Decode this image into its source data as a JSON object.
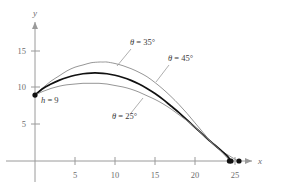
{
  "chart_data": {
    "type": "line",
    "title": "",
    "xlabel": "x",
    "ylabel": "y",
    "xlim": [
      0,
      27
    ],
    "ylim": [
      0,
      17
    ],
    "xticks": [
      5,
      10,
      15,
      20,
      25
    ],
    "yticks": [
      5,
      10,
      15
    ],
    "xtick_labels": [
      "5",
      "10",
      "15",
      "20",
      "25"
    ],
    "ytick_labels": [
      "5",
      "10",
      "15"
    ],
    "grid": false,
    "legend_position": "inline-annotations",
    "initial_height": 9,
    "initial_point": [
      0,
      9
    ],
    "series": [
      {
        "name": "theta = 35",
        "label": "θ = 35°",
        "color": "#8a8a8a",
        "width": 0.9,
        "apex": [
          8.5,
          13.5
        ],
        "landing": [
          25.5,
          0
        ],
        "points": [
          [
            0,
            9
          ],
          [
            1,
            10.0
          ],
          [
            2,
            10.9
          ],
          [
            3,
            11.6
          ],
          [
            4,
            12.3
          ],
          [
            5,
            12.8
          ],
          [
            6,
            13.1
          ],
          [
            7,
            13.4
          ],
          [
            8,
            13.5
          ],
          [
            8.5,
            13.5
          ],
          [
            9,
            13.5
          ],
          [
            10,
            13.3
          ],
          [
            11,
            13.0
          ],
          [
            12,
            12.6
          ],
          [
            13,
            12.1
          ],
          [
            14,
            11.5
          ],
          [
            15,
            10.7
          ],
          [
            16,
            9.8
          ],
          [
            17,
            8.8
          ],
          [
            18,
            7.7
          ],
          [
            19,
            6.5
          ],
          [
            20,
            5.2
          ],
          [
            21,
            3.9
          ],
          [
            22,
            2.6
          ],
          [
            23,
            1.6
          ],
          [
            24,
            0.9
          ],
          [
            25,
            0.25
          ],
          [
            25.5,
            0
          ]
        ]
      },
      {
        "name": "theta = 45",
        "label": "θ = 45°",
        "color": "#111111",
        "width": 1.7,
        "apex": [
          8.0,
          12.0
        ],
        "landing": [
          24.5,
          0
        ],
        "points": [
          [
            0,
            9
          ],
          [
            1,
            9.9
          ],
          [
            2,
            10.5
          ],
          [
            3,
            11.0
          ],
          [
            4,
            11.4
          ],
          [
            5,
            11.7
          ],
          [
            6,
            11.9
          ],
          [
            7,
            12.0
          ],
          [
            8,
            12.0
          ],
          [
            9,
            11.9
          ],
          [
            10,
            11.7
          ],
          [
            11,
            11.4
          ],
          [
            12,
            11.0
          ],
          [
            13,
            10.5
          ],
          [
            14,
            9.9
          ],
          [
            15,
            9.2
          ],
          [
            16,
            8.4
          ],
          [
            17,
            7.5
          ],
          [
            18,
            6.6
          ],
          [
            19,
            5.6
          ],
          [
            20,
            4.6
          ],
          [
            21,
            3.6
          ],
          [
            22,
            2.6
          ],
          [
            23,
            1.7
          ],
          [
            24,
            0.7
          ],
          [
            24.5,
            0
          ]
        ]
      },
      {
        "name": "theta = 25",
        "label": "θ = 25°",
        "color": "#8a8a8a",
        "width": 0.9,
        "apex": [
          8.0,
          10.6
        ],
        "landing": [
          24.3,
          0
        ],
        "points": [
          [
            0,
            9
          ],
          [
            1,
            9.5
          ],
          [
            2,
            9.9
          ],
          [
            3,
            10.2
          ],
          [
            4,
            10.4
          ],
          [
            5,
            10.5
          ],
          [
            6,
            10.6
          ],
          [
            7,
            10.6
          ],
          [
            8,
            10.6
          ],
          [
            9,
            10.5
          ],
          [
            10,
            10.3
          ],
          [
            11,
            10.1
          ],
          [
            12,
            9.8
          ],
          [
            13,
            9.4
          ],
          [
            14,
            8.9
          ],
          [
            15,
            8.4
          ],
          [
            16,
            7.8
          ],
          [
            17,
            7.1
          ],
          [
            18,
            6.3
          ],
          [
            19,
            5.5
          ],
          [
            20,
            4.6
          ],
          [
            21,
            3.6
          ],
          [
            22,
            2.6
          ],
          [
            23,
            1.6
          ],
          [
            24,
            0.45
          ],
          [
            24.3,
            0
          ]
        ]
      }
    ],
    "annotations": [
      {
        "id": "label-theta-35",
        "text": "θ = 35°",
        "symbol": "θ",
        "equals": " = ",
        "value": "35°",
        "text_xy": [
          130,
          45
        ],
        "leader_from": [
          131,
          49
        ],
        "leader_to": [
          117,
          66
        ]
      },
      {
        "id": "label-theta-45",
        "text": "θ = 45°",
        "symbol": "θ",
        "equals": " = ",
        "value": "45°",
        "text_xy": [
          168,
          61
        ],
        "leader_from": [
          169,
          65
        ],
        "leader_to": [
          156,
          82
        ]
      },
      {
        "id": "label-theta-25",
        "text": "θ = 25°",
        "symbol": "θ",
        "equals": " = ",
        "value": "25°",
        "text_xy": [
          112,
          119
        ],
        "leader_from": [
          131,
          113
        ],
        "leader_to": [
          143,
          98
        ]
      },
      {
        "id": "label-h",
        "text": "h = 9",
        "symbol": "h",
        "equals": " = ",
        "value": "9",
        "text_xy": [
          41,
          103
        ]
      }
    ],
    "markers": [
      {
        "name": "launch-point",
        "xy": [
          0,
          9
        ]
      },
      {
        "name": "landing-point-25",
        "xy": [
          24.3,
          0
        ]
      },
      {
        "name": "landing-point-45",
        "xy": [
          24.5,
          0
        ]
      },
      {
        "name": "landing-point-35",
        "xy": [
          25.5,
          0
        ]
      }
    ]
  },
  "axes": {
    "x_label": "x",
    "y_label": "y",
    "axis_color": "#9a9a9a",
    "tick_color": "#9a9a9a",
    "label_color": "#6d6d6d"
  }
}
